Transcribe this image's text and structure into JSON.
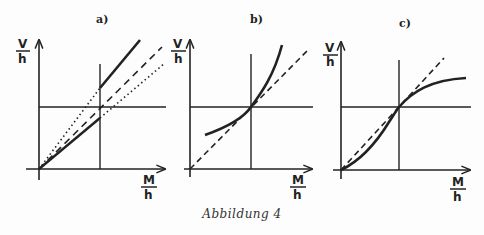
{
  "figure": {
    "caption": "Abbildung 4",
    "panels": [
      {
        "label": "a)",
        "y_label_num": "V",
        "y_label_den": "h",
        "x_label_num": "M",
        "x_label_den": "h"
      },
      {
        "label": "b)",
        "y_label_num": "V",
        "y_label_den": "h",
        "x_label_num": "M",
        "x_label_den": "h"
      },
      {
        "label": "c)",
        "y_label_num": "V",
        "y_label_den": "h",
        "x_label_num": "M",
        "x_label_den": "h"
      }
    ]
  },
  "colors": {
    "ink": "#222222",
    "background": "#fdfdfd"
  }
}
